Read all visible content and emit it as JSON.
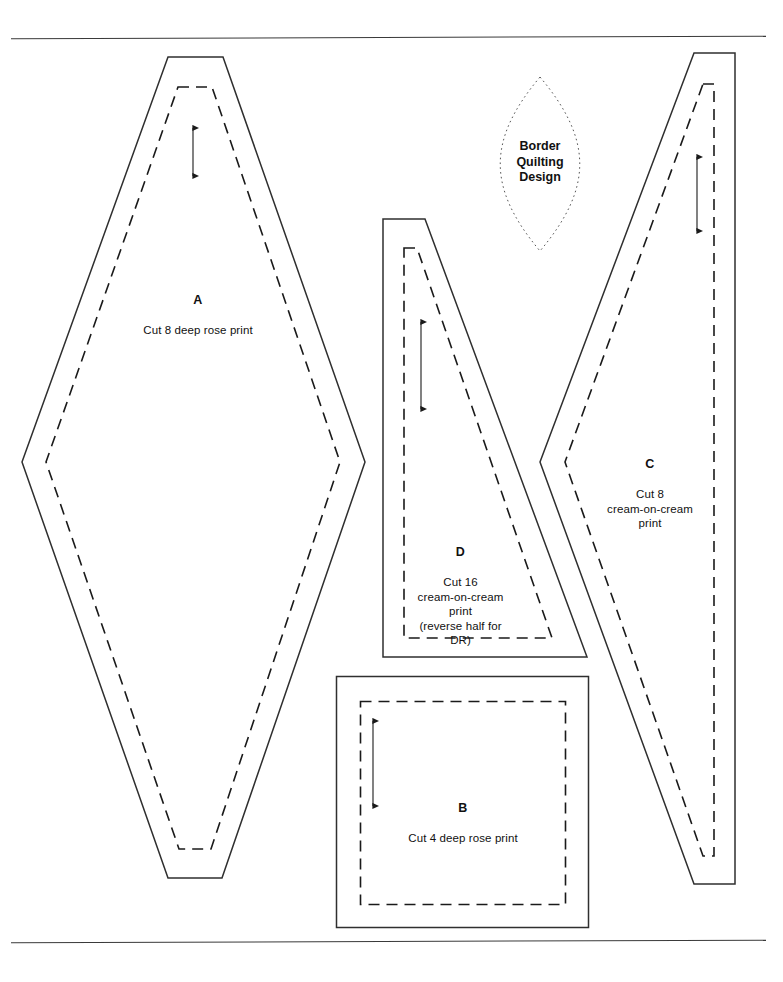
{
  "sheet": {
    "title": "Quilt Block Pattern Templates",
    "background_color": "#ffffff",
    "ink_color": "#2f2f2f",
    "text_color": "#111111",
    "width": 783,
    "height": 982
  },
  "rules": {
    "top_rule_label": "top-divider",
    "bottom_rule_label": "bottom-divider"
  },
  "pieces": [
    {
      "id": "A",
      "letter": "A",
      "note": "Cut 8 deep rose print",
      "shape": "elongated-diamond",
      "fabric": "deep rose print",
      "quantity": 8,
      "has_grain_arrow": true,
      "has_seam_line": true
    },
    {
      "id": "D",
      "letter": "D",
      "note": "Cut 16\ncream-on-cream\nprint\n(reverse half for\nDR)",
      "shape": "right-trapezoid",
      "fabric": "cream-on-cream print",
      "quantity": 16,
      "has_grain_arrow": true,
      "has_seam_line": true
    },
    {
      "id": "C",
      "letter": "C",
      "note": "Cut 8\ncream-on-cream\nprint",
      "shape": "elongated-kite",
      "fabric": "cream-on-cream print",
      "quantity": 8,
      "has_grain_arrow": true,
      "has_seam_line": true
    },
    {
      "id": "B",
      "letter": "B",
      "note": "Cut 4 deep rose print",
      "shape": "square",
      "fabric": "deep rose print",
      "quantity": 4,
      "has_grain_arrow": true,
      "has_seam_line": true
    }
  ],
  "quilting_design": {
    "label": "Border\nQuilting\nDesign",
    "shape": "pointed-oval",
    "outline_style": "dotted"
  }
}
